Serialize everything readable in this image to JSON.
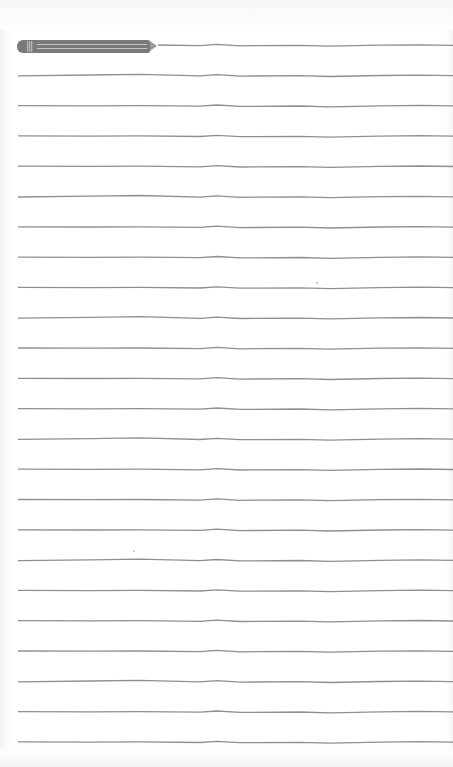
{
  "paper": {
    "type": "lined-notepad",
    "background_color": "#ffffff",
    "line_color": "#8f8f8f",
    "line_count": 24,
    "first_line_y": 45,
    "line_spacing": 30.3,
    "line_start_x": 18,
    "line_end_x": 453
  },
  "pencil": {
    "icon": "pencil-icon",
    "body_color": "#7a7a7a",
    "stripe_color": "#c4c4c4",
    "tip_color": "#9a9a9a"
  },
  "specks": [
    {
      "x": 316,
      "y": 282
    },
    {
      "x": 133,
      "y": 550
    }
  ]
}
